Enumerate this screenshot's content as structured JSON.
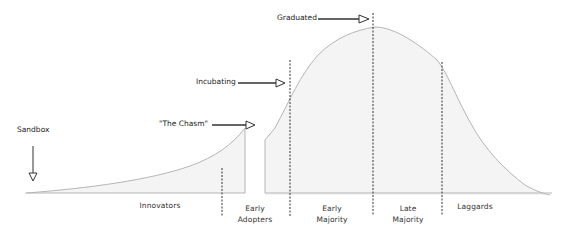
{
  "diagram": {
    "type": "technology adoption lifecycle curve",
    "segments": [
      {
        "id": "innovators",
        "label": "Innovators"
      },
      {
        "id": "early-adopters",
        "label_line1": "Early",
        "label_line2": "Adopters"
      },
      {
        "id": "early-majority",
        "label_line1": "Early",
        "label_line2": "Majority"
      },
      {
        "id": "late-majority",
        "label_line1": "Late",
        "label_line2": "Majority"
      },
      {
        "id": "laggards",
        "label": "Laggards"
      }
    ],
    "annotations": {
      "sandbox": "Sandbox",
      "chasm": "\"The Chasm\"",
      "incubating": "Incubating",
      "graduated": "Graduated"
    },
    "colors": {
      "curve_stroke": "#b5b5b5",
      "curve_fill": "#f4f4f4",
      "dashed_line": "#333333",
      "arrow": "#333333",
      "text": "#333333"
    }
  }
}
